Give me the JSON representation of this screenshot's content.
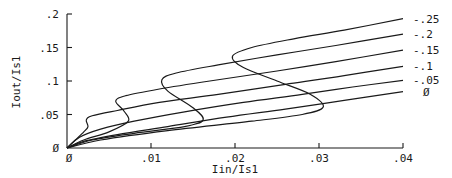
{
  "chart_data": {
    "type": "line",
    "title": "",
    "xlabel": "Iin/Is1",
    "ylabel": "Iout/Is1",
    "xlim": [
      0,
      0.04
    ],
    "ylim": [
      0,
      0.2
    ],
    "grid": false,
    "legend_position": "right-end labels",
    "x_ticks": [
      {
        "value": 0,
        "label": "0"
      },
      {
        "value": 0.01,
        "label": ".01"
      },
      {
        "value": 0.02,
        "label": ".02"
      },
      {
        "value": 0.03,
        "label": ".03"
      },
      {
        "value": 0.04,
        "label": ".04"
      }
    ],
    "y_ticks": [
      {
        "value": 0,
        "label": "0"
      },
      {
        "value": 0.05,
        "label": ".05"
      },
      {
        "value": 0.1,
        "label": ".1"
      },
      {
        "value": 0.15,
        "label": ".15"
      },
      {
        "value": 0.2,
        "label": ".2"
      }
    ],
    "series": [
      {
        "name": "-.25",
        "points": [
          [
            0,
            0
          ],
          [
            0.004,
            0.012
          ],
          [
            0.012,
            0.026
          ],
          [
            0.022,
            0.04
          ],
          [
            0.028,
            0.05
          ],
          [
            0.0305,
            0.061
          ],
          [
            0.029,
            0.08
          ],
          [
            0.025,
            0.1
          ],
          [
            0.021,
            0.12
          ],
          [
            0.0197,
            0.137
          ],
          [
            0.022,
            0.15
          ],
          [
            0.027,
            0.163
          ],
          [
            0.033,
            0.176
          ],
          [
            0.04,
            0.193
          ]
        ]
      },
      {
        "name": "-.2",
        "points": [
          [
            0,
            0
          ],
          [
            0.003,
            0.012
          ],
          [
            0.008,
            0.022
          ],
          [
            0.014,
            0.032
          ],
          [
            0.0162,
            0.042
          ],
          [
            0.015,
            0.06
          ],
          [
            0.012,
            0.085
          ],
          [
            0.0113,
            0.102
          ],
          [
            0.013,
            0.112
          ],
          [
            0.018,
            0.124
          ],
          [
            0.025,
            0.139
          ],
          [
            0.032,
            0.153
          ],
          [
            0.04,
            0.17
          ]
        ]
      },
      {
        "name": "-.15",
        "points": [
          [
            0,
            0
          ],
          [
            0.002,
            0.012
          ],
          [
            0.005,
            0.024
          ],
          [
            0.0073,
            0.04
          ],
          [
            0.0068,
            0.055
          ],
          [
            0.0058,
            0.07
          ],
          [
            0.007,
            0.078
          ],
          [
            0.011,
            0.088
          ],
          [
            0.017,
            0.1
          ],
          [
            0.025,
            0.115
          ],
          [
            0.032,
            0.129
          ],
          [
            0.04,
            0.146
          ]
        ]
      },
      {
        "name": "-.1",
        "points": [
          [
            0,
            0
          ],
          [
            0.001,
            0.012
          ],
          [
            0.002,
            0.024
          ],
          [
            0.0025,
            0.032
          ],
          [
            0.0023,
            0.042
          ],
          [
            0.003,
            0.048
          ],
          [
            0.006,
            0.056
          ],
          [
            0.011,
            0.068
          ],
          [
            0.018,
            0.08
          ],
          [
            0.026,
            0.095
          ],
          [
            0.033,
            0.108
          ],
          [
            0.04,
            0.122
          ]
        ]
      },
      {
        "name": "-.05",
        "points": [
          [
            0,
            0
          ],
          [
            0.0015,
            0.016
          ],
          [
            0.004,
            0.028
          ],
          [
            0.008,
            0.04
          ],
          [
            0.014,
            0.054
          ],
          [
            0.021,
            0.068
          ],
          [
            0.028,
            0.08
          ],
          [
            0.034,
            0.091
          ],
          [
            0.04,
            0.101
          ]
        ]
      },
      {
        "name": "0",
        "points": [
          [
            0,
            0
          ],
          [
            0.002,
            0.01
          ],
          [
            0.006,
            0.02
          ],
          [
            0.012,
            0.032
          ],
          [
            0.019,
            0.046
          ],
          [
            0.026,
            0.058
          ],
          [
            0.033,
            0.071
          ],
          [
            0.04,
            0.084
          ]
        ]
      }
    ],
    "series_labels_display": [
      "-.25",
      "-.2",
      "-.15",
      "-.1",
      "-.05",
      "0"
    ]
  }
}
